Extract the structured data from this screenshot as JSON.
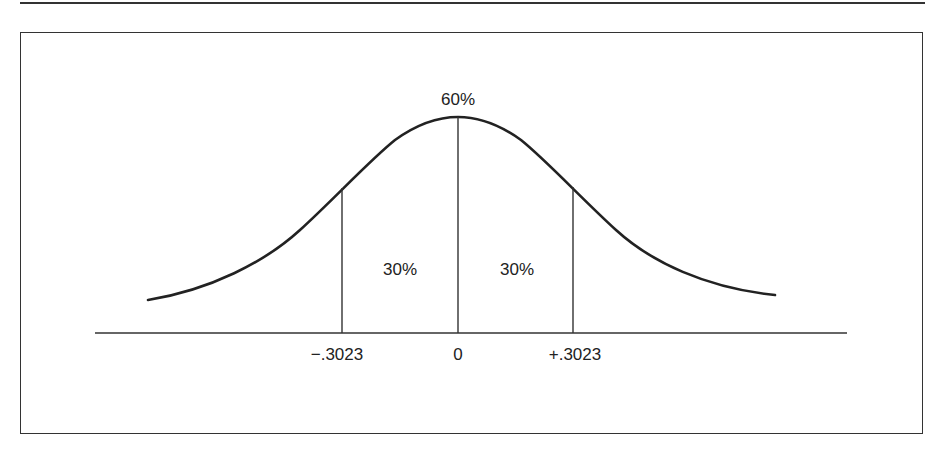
{
  "diagram": {
    "type": "normal-distribution-curve",
    "peak_label": "60%",
    "regions": [
      {
        "label": "30%",
        "side": "left"
      },
      {
        "label": "30%",
        "side": "right"
      }
    ],
    "axis_ticks": [
      {
        "label": "−.3023",
        "value": -0.3023
      },
      {
        "label": "0",
        "value": 0
      },
      {
        "label": "+.3023",
        "value": 0.3023
      }
    ]
  }
}
